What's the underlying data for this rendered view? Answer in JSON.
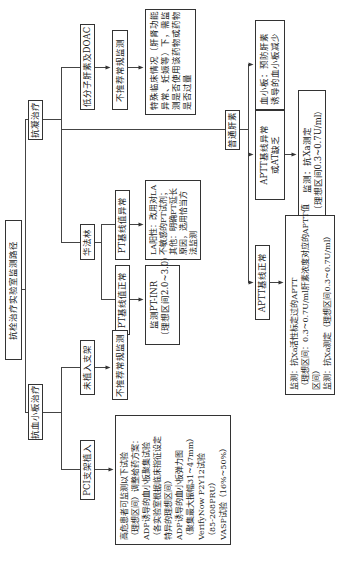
{
  "diagram": {
    "title": "抗栓治疗实验室监测路径",
    "orientation": "rotated-90-ccw",
    "branches": {
      "anticoagulant": {
        "label": "抗凝治疗",
        "lmwh": {
          "label": "低分子肝素及DOAC",
          "routine": "不推荐常规监测",
          "special_lines": [
            "特殊临床情况（肝肾功能",
            "异常、妊娠等）下，需监",
            "测是否使用该药物或药物",
            "是否过量"
          ]
        },
        "warfarin": {
          "label": "华法林",
          "pt_abnormal": "PT基线值异常",
          "pt_abnormal_lines": [
            "LA阳性：改用对LA",
            "不敏感的PT试剂；",
            "其他：明确PT延长",
            "原因，选用恰当方",
            "法监测"
          ],
          "pt_normal": "PT基线值正常",
          "pt_normal_lines": [
            "监测PT-INR",
            "（理想区间2.0~3.0）"
          ]
        },
        "heparin": {
          "label": "普通肝素",
          "platelet_lines": [
            "血小板：预防肝素",
            "诱导的血小板减少"
          ],
          "aptt_abnormal_lines": [
            "APTT基线异常",
            "或AT缺乏"
          ],
          "anti_xa_lines": [
            "监测：抗Xa测定",
            "（理想区间0.3~0.7U/ml）"
          ],
          "aptt_normal": "APTT基线正常",
          "aptt_normal_monitor_lines": [
            "监测：抗Xa活性标定过的APTT",
            "（理想区间：0.3~0.7U/ml肝素浓度对应的APTT值",
            "区间）",
            "监测：抗Xa测定（理想区间0.3~0.7U/ml）"
          ]
        }
      },
      "antiplatelet": {
        "label": "抗血小板治疗",
        "no_stent": "未植入支架",
        "no_stent_routine": "不推荐常规监测",
        "pci": "PCI支架植入",
        "pci_lines": [
          "高危患者可监测以下试验",
          "（理想区间）调整给药方案：",
          "ADP诱导的血小板聚集试验",
          "（各实验室根据临床指征设定",
          "特异的理想区间）",
          "ADP诱导的血小板弹力图",
          "（聚集最大振幅31~47mm）",
          "VerifyNow P2Y12试验",
          "（85-208PRU）",
          "VASP试验（16%~50%）"
        ]
      }
    }
  }
}
